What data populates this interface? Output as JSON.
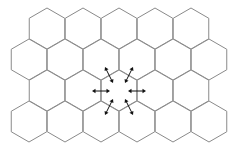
{
  "diagram": {
    "type": "hexagonal-cell-grid",
    "hex": {
      "side": 20.5,
      "stroke_color": "#8a8a8a",
      "fill_color": "#ffffff"
    },
    "rows": [
      {
        "y": 28.5,
        "x": [
          47,
          83,
          119,
          155,
          191
        ]
      },
      {
        "y": 59.5,
        "x": [
          29,
          65,
          101,
          137,
          173,
          209
        ]
      },
      {
        "y": 90.5,
        "x": [
          47,
          83,
          119,
          155,
          191
        ]
      },
      {
        "y": 121.5,
        "x": [
          29,
          65,
          101,
          137,
          173,
          209
        ]
      }
    ],
    "center_cell": {
      "x": 119,
      "y": 90.5
    },
    "arrow_color": "#111111",
    "arrows": [
      {
        "name": "arrow-left",
        "x1": 92,
        "y1": 91,
        "x2": 110,
        "y2": 91
      },
      {
        "name": "arrow-right",
        "x1": 128,
        "y1": 91,
        "x2": 146,
        "y2": 91
      },
      {
        "name": "arrow-upper-left",
        "x1": 105,
        "y1": 67,
        "x2": 113,
        "y2": 83
      },
      {
        "name": "arrow-upper-right",
        "x1": 133,
        "y1": 67,
        "x2": 125,
        "y2": 83
      },
      {
        "name": "arrow-lower-left",
        "x1": 105,
        "y1": 115,
        "x2": 113,
        "y2": 99
      },
      {
        "name": "arrow-lower-right",
        "x1": 133,
        "y1": 115,
        "x2": 125,
        "y2": 99
      }
    ]
  }
}
